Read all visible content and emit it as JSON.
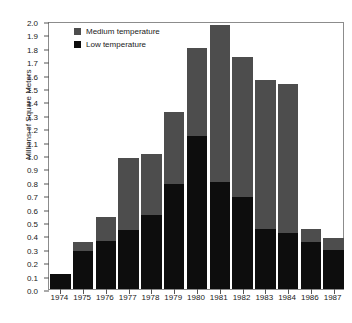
{
  "chart_data": {
    "type": "bar",
    "subtype": "stacked",
    "title": "",
    "xlabel": "",
    "ylabel": "Millions of Square Meters",
    "ylim": [
      0.0,
      2.0
    ],
    "ytick_step": 0.1,
    "grid": false,
    "legend_position": "top-left",
    "categories": [
      "1974",
      "1975",
      "1976",
      "1977",
      "1978",
      "1979",
      "1980",
      "1981",
      "1982",
      "1983",
      "1984",
      "1986",
      "1987"
    ],
    "ytick_labels": [
      "0.0",
      "0.1",
      "0.2",
      "0.3",
      "0.4",
      "0.5",
      "0.6",
      "0.7",
      "0.8",
      "0.9",
      "1.0",
      "1.1",
      "1.2",
      "1.3",
      "1.4",
      "1.5",
      "1.6",
      "1.7",
      "1.8",
      "1.9",
      "2.0"
    ],
    "series": [
      {
        "name": "Low temperature",
        "color": "#0d0d0d",
        "values": [
          0.11,
          0.28,
          0.36,
          0.44,
          0.55,
          0.78,
          1.14,
          0.8,
          0.69,
          0.45,
          0.42,
          0.35,
          0.29
        ]
      },
      {
        "name": "Medium temperature",
        "color": "#4d4d4d",
        "values": [
          0.0,
          0.07,
          0.18,
          0.54,
          0.46,
          0.54,
          0.66,
          1.17,
          1.04,
          1.11,
          1.11,
          0.1,
          0.09
        ]
      }
    ],
    "totals": [
      0.11,
      0.35,
      0.54,
      0.98,
      1.01,
      1.32,
      1.8,
      1.97,
      1.73,
      1.56,
      1.53,
      0.45,
      0.38
    ]
  },
  "legend": {
    "items": [
      {
        "label": "Medium temperature",
        "color": "#4d4d4d",
        "key": "med"
      },
      {
        "label": "Low temperature",
        "color": "#0d0d0d",
        "key": "low"
      }
    ]
  },
  "axis": {
    "y_title": "Millions of Square Meters"
  }
}
